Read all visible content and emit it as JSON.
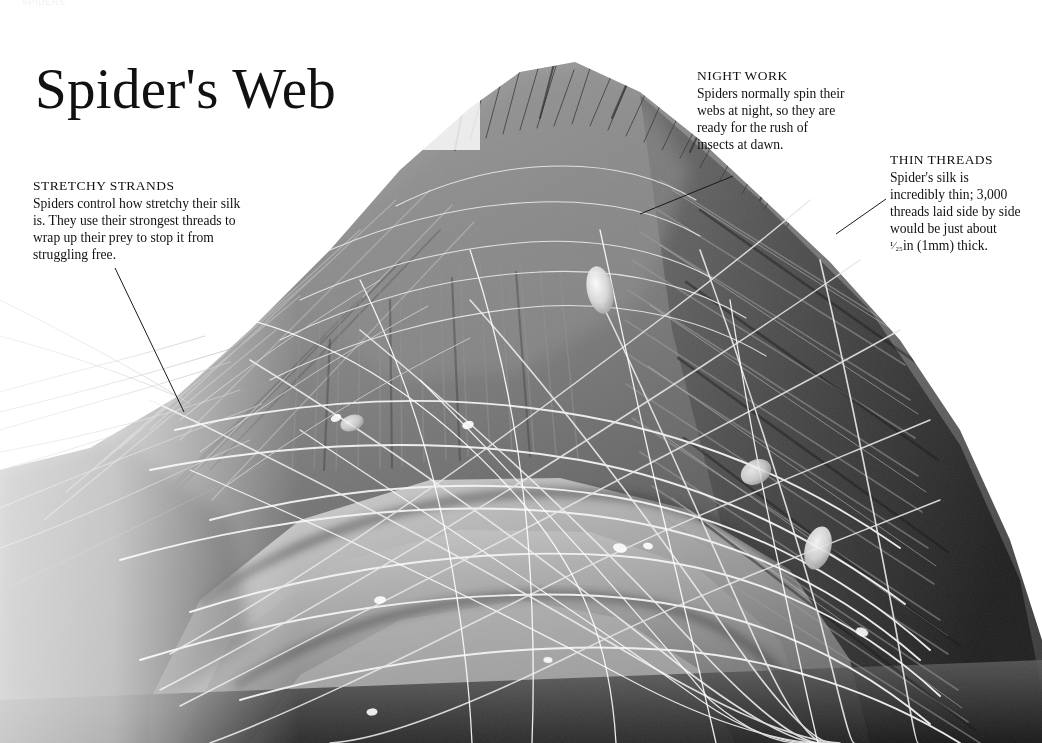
{
  "page": {
    "running_header": "SPIDERS",
    "title": "Spider's Web",
    "background_color": "#ffffff",
    "text_color": "#111111"
  },
  "photograph": {
    "caption_name": "spider-abdomen-silk-sem",
    "description": "Black and white scanning electron micrograph of a spider's abdomen covered with spun silk threads",
    "palette": {
      "highlight": "#f2f2f2",
      "light_gray": "#c9c9c9",
      "mid_gray": "#8a8a8a",
      "dark_gray": "#4a4a4a",
      "shadow": "#1d1d1d"
    }
  },
  "annotations": [
    {
      "id": "stretchy-strands",
      "heading": "STRETCHY STRANDS",
      "body": "Spiders control how stretchy their silk is. They use their strongest threads to wrap up their prey to stop it from struggling free.",
      "leader": {
        "x1": 115,
        "y1": 268,
        "x2": 184,
        "y2": 412
      }
    },
    {
      "id": "night-work",
      "heading": "NIGHT WORK",
      "body": "Spiders normally spin their webs at night, so they are ready for the rush of insects at dawn.",
      "leader": {
        "x1": 733,
        "y1": 176,
        "x2": 640,
        "y2": 214
      }
    },
    {
      "id": "thin-threads",
      "heading": "THIN THREADS",
      "body_before_fraction": "Spider's silk is incredibly thin; 3,000 threads laid side by side would be just about ",
      "fraction": "¹⁄₂₅",
      "body_after_fraction": "in (1mm) thick.",
      "leader": {
        "x1": 886,
        "y1": 199,
        "x2": 836,
        "y2": 234
      }
    }
  ]
}
